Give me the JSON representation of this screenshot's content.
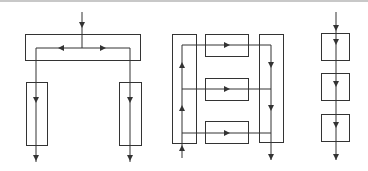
{
  "diagram": {
    "title": "",
    "colors": {
      "stroke": "#333333",
      "background": "#ffffff",
      "top_rule": "#c8c8c8"
    },
    "groups": [
      {
        "name": "fork-topology",
        "description": "Single input splits left and right into two parallel vertical blocks",
        "boxes": [
          {
            "id": "top-distributor",
            "x": 25,
            "y": 34,
            "w": 115,
            "h": 26
          },
          {
            "id": "left-branch",
            "x": 26,
            "y": 82,
            "w": 21,
            "h": 63
          },
          {
            "id": "right-branch",
            "x": 119,
            "y": 82,
            "w": 22,
            "h": 63
          }
        ]
      },
      {
        "name": "serpentine-topology",
        "description": "Input enters bottom-left, flows up, across three horizontal blocks, down the right column",
        "boxes": [
          {
            "id": "left-column",
            "x": 172,
            "y": 34,
            "w": 24,
            "h": 109
          },
          {
            "id": "right-column",
            "x": 259,
            "y": 34,
            "w": 24,
            "h": 108
          },
          {
            "id": "row-block-1",
            "x": 205,
            "y": 34,
            "w": 43,
            "h": 22
          },
          {
            "id": "row-block-2",
            "x": 205,
            "y": 78,
            "w": 43,
            "h": 22
          },
          {
            "id": "row-block-3",
            "x": 205,
            "y": 121,
            "w": 43,
            "h": 22
          }
        ]
      },
      {
        "name": "series-topology",
        "description": "Single vertical flow through three stacked blocks",
        "boxes": [
          {
            "id": "series-block-1",
            "x": 321,
            "y": 33,
            "w": 28,
            "h": 27
          },
          {
            "id": "series-block-2",
            "x": 321,
            "y": 73,
            "w": 28,
            "h": 27
          },
          {
            "id": "series-block-3",
            "x": 321,
            "y": 114,
            "w": 28,
            "h": 27
          }
        ]
      }
    ]
  }
}
